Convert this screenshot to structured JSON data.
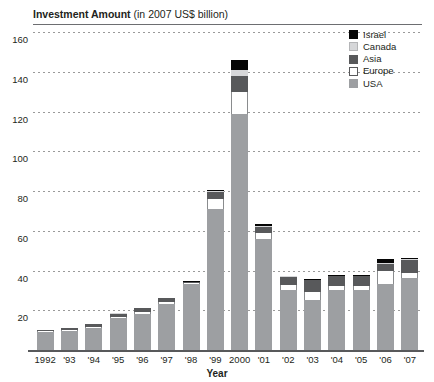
{
  "chart_data": {
    "type": "bar",
    "stacked": true,
    "title": "Investment Amount (in 2007 US$ billion)",
    "title_bold_part": "Investment Amount",
    "title_rest_part": " (in 2007 US$ billion)",
    "xlabel": "Year",
    "ylabel": "",
    "ylim": [
      0,
      160
    ],
    "ytick_step": 20,
    "grid": true,
    "legend_position": "top-right",
    "categories": [
      "1992",
      "'93",
      "'94",
      "'95",
      "'96",
      "'97",
      "'98",
      "'99",
      "2000",
      "'01",
      "'02",
      "'03",
      "'04",
      "'05",
      "'06",
      "'07"
    ],
    "ytick_labels": [
      "160",
      "140",
      "120",
      "100",
      "80",
      "60",
      "40",
      "20"
    ],
    "ytick_values": [
      160,
      140,
      120,
      100,
      80,
      60,
      40,
      20
    ],
    "series": [
      {
        "name": "USA",
        "color": "#9d9fa2",
        "values": [
          9.0,
          9.5,
          11.0,
          16.0,
          18.0,
          23.0,
          33.0,
          71.0,
          119.0,
          56.0,
          30.0,
          25.0,
          30.0,
          30.0,
          33.0,
          36.0
        ]
      },
      {
        "name": "Europe",
        "color": "#ffffff",
        "values": [
          0.6,
          0.6,
          0.6,
          0.8,
          1.0,
          1.2,
          0.8,
          5.0,
          11.0,
          3.0,
          2.5,
          4.0,
          2.0,
          2.0,
          7.0,
          2.5
        ]
      },
      {
        "name": "Asia",
        "color": "#58595b",
        "values": [
          0.4,
          1.0,
          1.4,
          1.4,
          2.0,
          1.8,
          0.4,
          3.5,
          8.0,
          3.0,
          4.0,
          6.0,
          5.0,
          5.0,
          3.5,
          7.0
        ]
      },
      {
        "name": "Canada",
        "color": "#d6d7d9",
        "values": [
          0.0,
          0.0,
          0.0,
          0.2,
          0.2,
          0.2,
          0.2,
          0.5,
          3.0,
          0.5,
          0.5,
          0.3,
          0.3,
          0.3,
          0.5,
          0.3
        ]
      },
      {
        "name": "Israel",
        "color": "#050505",
        "values": [
          0.0,
          0.0,
          0.2,
          0.2,
          0.2,
          0.2,
          0.2,
          0.6,
          5.0,
          1.0,
          0.3,
          0.3,
          0.3,
          0.3,
          1.8,
          0.3
        ]
      }
    ],
    "totals": [
      10.0,
      11.1,
      13.2,
      18.6,
      21.4,
      26.4,
      34.6,
      80.6,
      146.0,
      63.5,
      37.3,
      35.6,
      37.6,
      37.6,
      45.8,
      46.1
    ]
  },
  "legend": {
    "items": [
      {
        "label": "Israel",
        "swatch": "israel-swatch"
      },
      {
        "label": "Canada",
        "swatch": "canada-swatch"
      },
      {
        "label": "Asia",
        "swatch": "asia-swatch"
      },
      {
        "label": "Europe",
        "swatch": "europe-swatch"
      },
      {
        "label": "USA",
        "swatch": "usa-swatch"
      }
    ]
  }
}
